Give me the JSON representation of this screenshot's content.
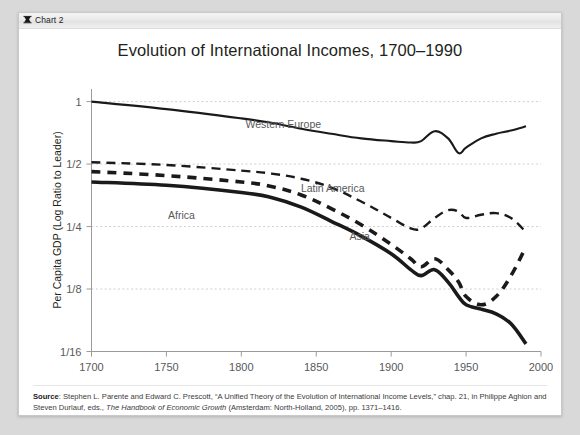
{
  "window": {
    "titlebar": {
      "icon": "chart-bookmark-icon",
      "label": "Chart 2"
    }
  },
  "chart_data": {
    "type": "line",
    "title": "Evolution of International Incomes, 1700–1990",
    "xlabel": "",
    "ylabel": "Per Capita GDP (Log Ratio to Leader)",
    "xlim": [
      1700,
      2000
    ],
    "ylim": [
      0.0625,
      1.15
    ],
    "yscale": "log",
    "xticks": [
      1700,
      1750,
      1800,
      1850,
      1900,
      1950,
      2000
    ],
    "xticklabels": [
      "1700",
      "1750",
      "1800",
      "1850",
      "1900",
      "1950",
      "2000"
    ],
    "yticks": [
      1,
      0.5,
      0.25,
      0.125,
      0.0625
    ],
    "yticklabels": [
      "1",
      "1/2",
      "1/4",
      "1/8",
      "1/16"
    ],
    "grid": "horizontal-dotted",
    "legend": "inline-annotations",
    "series": [
      {
        "name": "Western Europe",
        "style": "solid-thin",
        "label_x": 1828,
        "label_y": 0.78,
        "x": [
          1700,
          1750,
          1800,
          1820,
          1840,
          1860,
          1880,
          1900,
          1913,
          1920,
          1929,
          1938,
          1945,
          1950,
          1960,
          1970,
          1980,
          1990
        ],
        "y": [
          1.0,
          0.92,
          0.83,
          0.79,
          0.74,
          0.7,
          0.665,
          0.645,
          0.635,
          0.645,
          0.72,
          0.665,
          0.565,
          0.6,
          0.665,
          0.7,
          0.725,
          0.76
        ]
      },
      {
        "name": "Latin America",
        "style": "dashed-long",
        "label_x": 1861,
        "label_y": 0.385,
        "x": [
          1700,
          1750,
          1800,
          1820,
          1840,
          1860,
          1880,
          1900,
          1913,
          1920,
          1929,
          1938,
          1945,
          1950,
          1960,
          1970,
          1980,
          1990
        ],
        "y": [
          0.51,
          0.495,
          0.465,
          0.45,
          0.425,
          0.385,
          0.33,
          0.275,
          0.245,
          0.245,
          0.275,
          0.3,
          0.295,
          0.275,
          0.285,
          0.29,
          0.275,
          0.235
        ]
      },
      {
        "name": "Asia",
        "style": "dashed-bold",
        "label_x": 1879,
        "label_y": 0.225,
        "x": [
          1700,
          1750,
          1800,
          1820,
          1840,
          1860,
          1880,
          1900,
          1913,
          1920,
          1929,
          1938,
          1945,
          1950,
          1960,
          1970,
          1980,
          1990
        ],
        "y": [
          0.46,
          0.44,
          0.41,
          0.39,
          0.355,
          0.305,
          0.255,
          0.205,
          0.175,
          0.16,
          0.175,
          0.155,
          0.135,
          0.115,
          0.105,
          0.115,
          0.145,
          0.2
        ]
      },
      {
        "name": "Africa",
        "style": "solid-bold",
        "label_x": 1760,
        "label_y": 0.285,
        "x": [
          1700,
          1750,
          1800,
          1820,
          1840,
          1860,
          1880,
          1900,
          1913,
          1920,
          1929,
          1938,
          1945,
          1950,
          1960,
          1970,
          1980,
          1990
        ],
        "y": [
          0.41,
          0.395,
          0.365,
          0.345,
          0.31,
          0.265,
          0.225,
          0.185,
          0.155,
          0.145,
          0.155,
          0.135,
          0.115,
          0.105,
          0.1,
          0.095,
          0.085,
          0.068
        ]
      }
    ]
  },
  "source_note": {
    "prefix": "Source",
    "text_1": ": Stephen L. Parente and Edward C. Prescott, “A Unified Theory of the Evolution of International Income Levels,” chap. 21, in Philippe Aghion and Steven Durlauf, eds., ",
    "italic": "The Handbook of Economic Growth",
    "text_2": " (Amsterdam: North-Holland, 2005), pp. 1371–1416."
  }
}
